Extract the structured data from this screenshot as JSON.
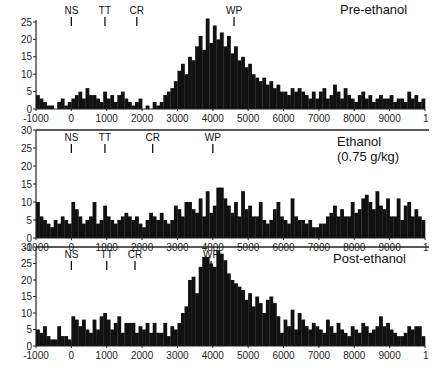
{
  "chart_data": [
    {
      "type": "bar",
      "title": "Pre-ethanol",
      "subtitle": "",
      "xlabel": "",
      "ylabel": "",
      "xlim": [
        -1000,
        10000
      ],
      "ylim": [
        0,
        25
      ],
      "yticks": [
        0,
        5,
        10,
        15,
        20,
        25
      ],
      "xticks": [
        -1000,
        0,
        1000,
        2000,
        3000,
        4000,
        5000,
        6000,
        7000,
        8000,
        9000,
        10000
      ],
      "xtick_labels": [
        "-1000",
        "0",
        "1000",
        "2000",
        "3000",
        "4000",
        "5000",
        "6000",
        "7000",
        "8000",
        "9000",
        "1"
      ],
      "bin_width": 100,
      "x_start": -1000,
      "markers": [
        {
          "label": "NS",
          "x": 0
        },
        {
          "label": "TT",
          "x": 950
        },
        {
          "label": "CR",
          "x": 1850
        },
        {
          "label": "WP",
          "x": 4600
        }
      ],
      "values": [
        4,
        3,
        2,
        1,
        1,
        0,
        2,
        3,
        1,
        2,
        3,
        4,
        5,
        3,
        6,
        4,
        4,
        3,
        2,
        5,
        3,
        4,
        2,
        4,
        5,
        3,
        2,
        1,
        2,
        3,
        0,
        1,
        0,
        2,
        1,
        2,
        4,
        5,
        6,
        8,
        11,
        13,
        10,
        15,
        14,
        18,
        21,
        17,
        26,
        19,
        24,
        20,
        22,
        18,
        21,
        16,
        18,
        14,
        15,
        12,
        13,
        10,
        9,
        8,
        9,
        7,
        8,
        6,
        7,
        5,
        5,
        4,
        6,
        5,
        6,
        5,
        4,
        3,
        5,
        3,
        5,
        6,
        3,
        4,
        7,
        5,
        3,
        6,
        4,
        3,
        2,
        4,
        5,
        3,
        4,
        2,
        3,
        4,
        3,
        3,
        4,
        2,
        3,
        3,
        2,
        5,
        3,
        4,
        2,
        3
      ]
    },
    {
      "type": "bar",
      "title": "Ethanol",
      "subtitle": "(0.75 g/kg)",
      "xlabel": "",
      "ylabel": "",
      "xlim": [
        -1000,
        10000
      ],
      "ylim": [
        0,
        30
      ],
      "yticks": [
        0,
        5,
        10,
        15,
        20,
        25,
        30
      ],
      "xticks": [
        -1000,
        0,
        1000,
        2000,
        3000,
        4000,
        5000,
        6000,
        7000,
        8000,
        9000,
        10000
      ],
      "xtick_labels": [
        "-1000",
        "0",
        "1000",
        "2000",
        "3000",
        "4000",
        "5000",
        "6000",
        "7000",
        "8000",
        "9000",
        "1"
      ],
      "bin_width": 100,
      "x_start": -1000,
      "markers": [
        {
          "label": "NS",
          "x": 0
        },
        {
          "label": "TT",
          "x": 950
        },
        {
          "label": "CR",
          "x": 2300
        },
        {
          "label": "WP",
          "x": 4000
        }
      ],
      "values": [
        10,
        6,
        5,
        4,
        3,
        5,
        4,
        6,
        5,
        4,
        10,
        8,
        6,
        4,
        5,
        6,
        10,
        4,
        5,
        9,
        6,
        5,
        4,
        5,
        6,
        7,
        6,
        5,
        6,
        4,
        3,
        5,
        7,
        6,
        5,
        7,
        5,
        4,
        5,
        9,
        8,
        6,
        10,
        10,
        8,
        7,
        11,
        6,
        13,
        7,
        9,
        14,
        14,
        11,
        9,
        7,
        10,
        6,
        13,
        8,
        9,
        6,
        6,
        10,
        5,
        4,
        5,
        8,
        10,
        6,
        5,
        4,
        11,
        6,
        5,
        5,
        4,
        5,
        3,
        3,
        4,
        4,
        6,
        7,
        9,
        6,
        8,
        6,
        6,
        10,
        7,
        8,
        11,
        12,
        10,
        8,
        13,
        9,
        8,
        11,
        6,
        6,
        11,
        5,
        9,
        10,
        6,
        8,
        6,
        5
      ]
    },
    {
      "type": "bar",
      "title": "Post-ethanol",
      "subtitle": "",
      "xlabel": "",
      "ylabel": "",
      "xlim": [
        -1000,
        10000
      ],
      "ylim": [
        0,
        30
      ],
      "yticks": [
        0,
        5,
        10,
        15,
        20,
        25,
        30
      ],
      "xticks": [
        -1000,
        0,
        1000,
        2000,
        3000,
        4000,
        5000,
        6000,
        7000,
        8000,
        9000,
        10000
      ],
      "xtick_labels": [
        "-1000",
        "0",
        "1000",
        "2000",
        "3000",
        "4000",
        "5000",
        "6000",
        "7000",
        "8000",
        "9000",
        "1"
      ],
      "bin_width": 100,
      "x_start": -1000,
      "markers": [
        {
          "label": "NS",
          "x": 0
        },
        {
          "label": "TT",
          "x": 1000
        },
        {
          "label": "CR",
          "x": 1800
        },
        {
          "label": "WP",
          "x": 3950
        }
      ],
      "values": [
        5,
        4,
        6,
        3,
        2,
        2,
        6,
        3,
        3,
        2,
        9,
        8,
        6,
        8,
        5,
        4,
        8,
        5,
        9,
        10,
        8,
        5,
        7,
        9,
        4,
        7,
        7,
        7,
        4,
        6,
        5,
        7,
        4,
        7,
        4,
        4,
        7,
        3,
        6,
        5,
        7,
        10,
        12,
        20,
        21,
        16,
        24,
        27,
        27,
        25,
        24,
        29,
        28,
        26,
        22,
        20,
        19,
        18,
        17,
        14,
        16,
        12,
        15,
        13,
        10,
        14,
        15,
        13,
        9,
        4,
        8,
        6,
        11,
        5,
        10,
        8,
        6,
        5,
        7,
        6,
        5,
        4,
        8,
        6,
        4,
        7,
        5,
        4,
        3,
        6,
        5,
        4,
        7,
        6,
        4,
        5,
        6,
        9,
        6,
        7,
        5,
        4,
        3,
        3,
        4,
        6,
        5,
        6,
        6,
        3
      ]
    }
  ],
  "panels": [
    {
      "title": "Pre-ethanol",
      "subtitle": ""
    },
    {
      "title": "Ethanol",
      "subtitle": "(0.75 g/kg)"
    },
    {
      "title": "Post-ethanol",
      "subtitle": ""
    }
  ],
  "colors": {
    "bars": "#111111",
    "axes": "#222222",
    "background": "#ffffff"
  }
}
